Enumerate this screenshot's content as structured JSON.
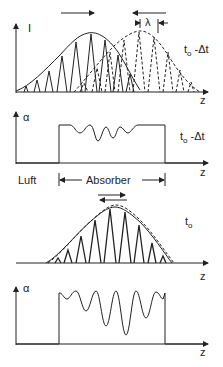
{
  "panels": [
    {
      "id": "intensity-t0-minus-dt",
      "y_label": "I",
      "x_label": "z",
      "time_label": "t",
      "time_sub": "o",
      "time_suffix": " -Δt",
      "wavelength_label": "λ"
    },
    {
      "id": "absorption-t0-minus-dt",
      "y_label": "α",
      "x_label": "z",
      "time_label": "t",
      "time_sub": "o",
      "time_suffix": " -Δt",
      "region_left_label": "Luft",
      "region_absorber_label": "Absorber"
    },
    {
      "id": "intensity-t0",
      "x_label": "z",
      "time_label": "t",
      "time_sub": "o"
    },
    {
      "id": "absorption-t0",
      "y_label": "α",
      "x_label": "z"
    }
  ],
  "colors": {
    "line": "#222222",
    "background": "#ffffff"
  }
}
